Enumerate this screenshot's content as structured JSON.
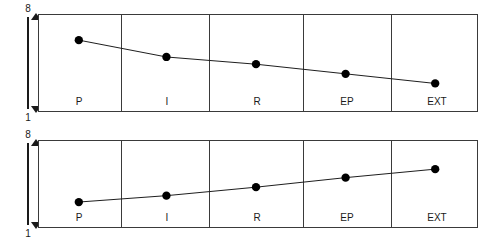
{
  "figure": {
    "background_color": "#ffffff",
    "line_color": "#1a1a1a",
    "marker_color": "#000000",
    "frame_color": "#3a3a3a"
  },
  "axis": {
    "top_tick_label": "8",
    "bottom_tick_label": "1",
    "arrow_icon": "double-headed-vertical-arrow"
  },
  "chart_data": [
    {
      "type": "line",
      "title": "",
      "subtitle": "",
      "xlabel": "",
      "ylabel": "",
      "categories": [
        "P",
        "I",
        "R",
        "EP",
        "EXT"
      ],
      "values": [
        6.4,
        5.0,
        4.4,
        3.6,
        2.8
      ],
      "ylim": [
        1,
        8
      ],
      "ytick_labels": [
        "8",
        "1"
      ],
      "grid": "vertical-category-separators",
      "legend": "none",
      "markers": "filled-circle",
      "trend": "decreasing"
    },
    {
      "type": "line",
      "title": "",
      "subtitle": "",
      "xlabel": "",
      "ylabel": "",
      "categories": [
        "P",
        "I",
        "R",
        "EP",
        "EXT"
      ],
      "values": [
        2.8,
        3.4,
        4.2,
        5.1,
        5.9
      ],
      "ylim": [
        1,
        8
      ],
      "ytick_labels": [
        "8",
        "1"
      ],
      "grid": "vertical-category-separators",
      "legend": "none",
      "markers": "filled-circle",
      "trend": "increasing"
    }
  ]
}
